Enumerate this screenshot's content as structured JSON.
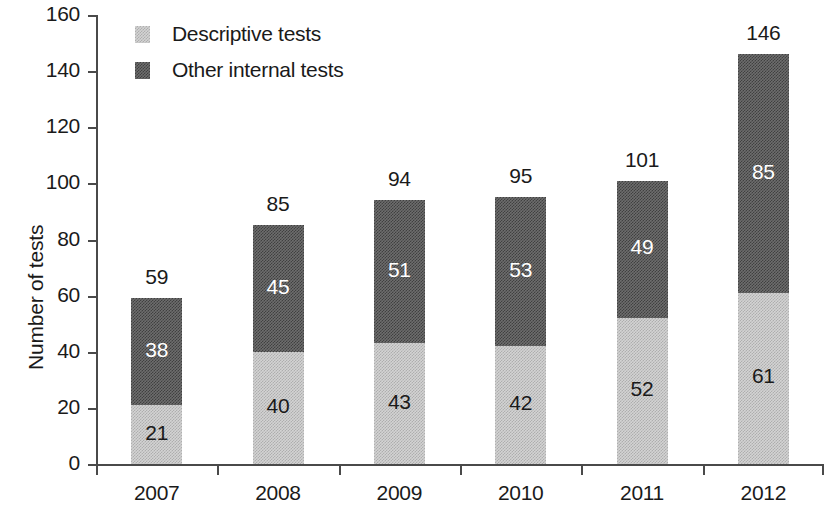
{
  "chart_data": {
    "type": "bar",
    "subtype": "stacked-vertical",
    "title": "",
    "xlabel": "",
    "ylabel": "Number of tests",
    "categories": [
      "2007",
      "2008",
      "2009",
      "2010",
      "2011",
      "2012"
    ],
    "series": [
      {
        "name": "Descriptive tests",
        "values": [
          21,
          40,
          43,
          42,
          52,
          61
        ],
        "color": "#d3d3d3"
      },
      {
        "name": "Other internal tests",
        "values": [
          38,
          45,
          51,
          53,
          49,
          85
        ],
        "color": "#6d6d6d"
      }
    ],
    "totals": [
      59,
      85,
      94,
      95,
      101,
      146
    ],
    "ylim": [
      0,
      160
    ],
    "yticks": [
      0,
      20,
      40,
      60,
      80,
      100,
      120,
      140,
      160
    ],
    "ytick_labels": [
      "0",
      "20",
      "40",
      "60",
      "80",
      "100",
      "120",
      "140",
      "160"
    ],
    "grid": false,
    "legend_position": "top-left-inside",
    "legend": [
      {
        "label": "Descriptive tests",
        "swatch": "light-dither"
      },
      {
        "label": "Other internal tests",
        "swatch": "dark-dither"
      }
    ],
    "bar_labels": {
      "descriptive": [
        "21",
        "40",
        "43",
        "42",
        "52",
        "61"
      ],
      "other_internal": [
        "38",
        "45",
        "51",
        "53",
        "49",
        "85"
      ],
      "totals": [
        "59",
        "85",
        "94",
        "95",
        "101",
        "146"
      ]
    }
  },
  "colors": {
    "light_fill": "#d3d3d3",
    "dark_fill": "#6d6d6d",
    "axis": "#4a4a4a",
    "text": "#1a1a1a",
    "label_on_dark": "#ffffff",
    "background": "#ffffff"
  }
}
